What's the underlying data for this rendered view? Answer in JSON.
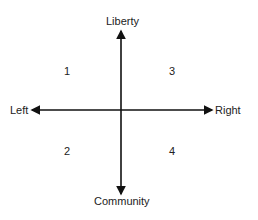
{
  "diagram": {
    "axes": {
      "top": "Liberty",
      "bottom": "Community",
      "left": "Left",
      "right": "Right"
    },
    "quadrants": {
      "top_left": "1",
      "bottom_left": "2",
      "top_right": "3",
      "bottom_right": "4"
    },
    "colors": {
      "line": "#111111",
      "text": "#222222"
    }
  }
}
